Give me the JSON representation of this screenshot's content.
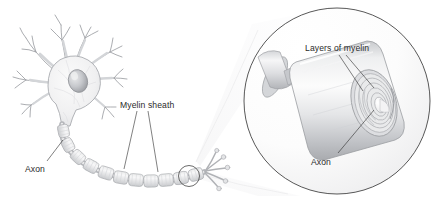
{
  "figure": {
    "background_color": "#ffffff",
    "label_color": "#2b2b2b",
    "outline_color": "#8e9095",
    "fill_light": "#f2f2f3",
    "fill_mid": "#dcdddf",
    "fill_dark": "#b9bbbf"
  },
  "labels": {
    "axon_left": "Axon",
    "myelin_sheath": "Myelin sheath",
    "layers_of_myelin": "Layers of myelin",
    "axon_inset": "Axon"
  },
  "parts": {
    "cell_body": "cell-body",
    "nucleus": "nucleus",
    "dendrites": "dendrites",
    "axon": "axon",
    "myelin_segments": "myelin-segments",
    "nodes_of_ranvier": "nodes-of-ranvier",
    "axon_terminals": "axon-terminals",
    "magnifier_circle": "magnifier-circle",
    "magnifier_cone": "magnifier-cone",
    "highlight_circle": "highlight-circle",
    "myelin_spiral": "myelin-spiral",
    "inset_axon_core": "inset-axon-core"
  },
  "counts": {
    "myelin_segments": 11,
    "dendrite_branches": 8,
    "terminal_branches": 5,
    "myelin_spiral_turns": 4
  }
}
